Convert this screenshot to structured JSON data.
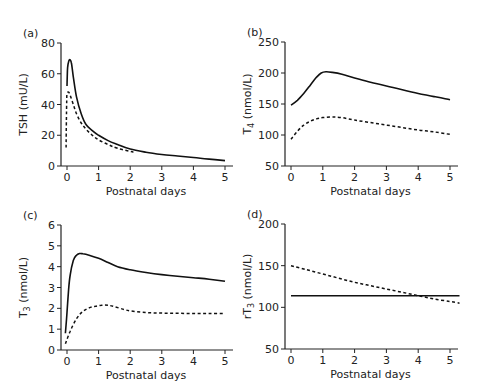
{
  "chart_data": [
    {
      "panel": "(a)",
      "type": "line",
      "xlabel": "Postnatal days",
      "ylabel": "TSH (mU/L)",
      "xlim": [
        0,
        5
      ],
      "ylim": [
        0,
        80
      ],
      "xticks": [
        0,
        1,
        2,
        3,
        4,
        5
      ],
      "yticks": [
        0,
        20,
        40,
        60,
        80
      ],
      "grid": false,
      "frame": {
        "x0": 61,
        "yTop": 43,
        "yBot": 166,
        "px0": 67,
        "px5": 225
      },
      "series": [
        {
          "name": "solid",
          "style": "solid",
          "x": [
            0,
            0.02,
            0.06,
            0.1,
            0.14,
            0.2,
            0.3,
            0.45,
            0.6,
            0.8,
            1.0,
            1.3,
            1.6,
            2.0,
            2.5,
            3.0,
            3.5,
            4.0,
            4.5,
            5.0
          ],
          "y": [
            52,
            64,
            68.5,
            69,
            67,
            58,
            45,
            34,
            27,
            23,
            20,
            16.5,
            14,
            11,
            9,
            7.5,
            6.5,
            5.5,
            4.5,
            3.5
          ]
        },
        {
          "name": "dashed",
          "style": "dashed",
          "x": [
            -0.03,
            -0.02,
            -0.01,
            0,
            0.05,
            0.1,
            0.2,
            0.3,
            0.45,
            0.6,
            0.8,
            1.0,
            1.3,
            1.6,
            2.1
          ],
          "y": [
            12,
            30,
            42,
            47,
            48,
            46,
            40,
            34,
            28,
            24,
            20,
            17,
            14,
            11.5,
            9
          ]
        }
      ]
    },
    {
      "panel": "(b)",
      "type": "line",
      "xlabel": "Postnatal days",
      "ylabel": "T4 (nmol/L)",
      "ylabel_main": "T",
      "ylabel_sub": "4",
      "ylabel_tail": " (nmol/L)",
      "xlim": [
        0,
        5
      ],
      "ylim": [
        50,
        250
      ],
      "xticks": [
        0,
        1,
        2,
        3,
        4,
        5
      ],
      "yticks": [
        50,
        100,
        150,
        200,
        250
      ],
      "grid": false,
      "frame": {
        "x0": 285,
        "yTop": 42,
        "yBot": 166,
        "px0": 291,
        "px5": 450
      },
      "series": [
        {
          "name": "solid",
          "style": "solid",
          "x": [
            0,
            0.2,
            0.4,
            0.6,
            0.8,
            0.95,
            1.1,
            1.3,
            1.6,
            2.0,
            2.5,
            3.0,
            3.5,
            4.0,
            4.5,
            5.0
          ],
          "y": [
            148,
            156,
            167,
            180,
            193,
            200,
            202,
            201,
            198,
            192,
            185,
            179,
            173,
            167,
            162,
            157
          ]
        },
        {
          "name": "dashed",
          "style": "dashed",
          "x": [
            0,
            0.2,
            0.4,
            0.6,
            0.8,
            1.0,
            1.3,
            1.6,
            2.0,
            2.5,
            3.0,
            3.5,
            4.0,
            4.5,
            5.0
          ],
          "y": [
            93,
            106,
            116,
            122,
            126,
            128,
            129,
            128,
            124,
            120,
            116,
            112,
            108,
            105,
            101
          ]
        }
      ]
    },
    {
      "panel": "(c)",
      "type": "line",
      "xlabel": "Postnatal days",
      "ylabel": "T3 (nmol/L)",
      "ylabel_main": "T",
      "ylabel_sub": "3",
      "ylabel_tail": " (nmol/L)",
      "xlim": [
        0,
        5
      ],
      "ylim": [
        0,
        6
      ],
      "xticks": [
        0,
        1,
        2,
        3,
        4,
        5
      ],
      "yticks": [
        0,
        1,
        2,
        3,
        4,
        5,
        6
      ],
      "grid": false,
      "frame": {
        "x0": 61,
        "yTop": 225,
        "yBot": 350,
        "px0": 67,
        "px5": 225
      },
      "series": [
        {
          "name": "solid",
          "style": "solid",
          "x": [
            -0.05,
            0,
            0.05,
            0.1,
            0.2,
            0.3,
            0.4,
            0.5,
            0.7,
            1.0,
            1.3,
            1.6,
            2.0,
            2.5,
            3.0,
            3.5,
            4.0,
            4.5,
            5.0
          ],
          "y": [
            0.8,
            1.8,
            2.9,
            3.6,
            4.3,
            4.55,
            4.63,
            4.62,
            4.55,
            4.4,
            4.2,
            4.0,
            3.85,
            3.72,
            3.62,
            3.54,
            3.47,
            3.4,
            3.3
          ]
        },
        {
          "name": "dashed",
          "style": "dashed",
          "x": [
            -0.05,
            0.1,
            0.3,
            0.5,
            0.7,
            0.9,
            1.1,
            1.3,
            1.5,
            1.8,
            2.0,
            2.5,
            3.0,
            3.5,
            4.0,
            4.5,
            5.0
          ],
          "y": [
            0.3,
            0.9,
            1.5,
            1.85,
            2.02,
            2.1,
            2.15,
            2.15,
            2.08,
            1.95,
            1.88,
            1.8,
            1.77,
            1.76,
            1.75,
            1.75,
            1.75
          ]
        }
      ]
    },
    {
      "panel": "(d)",
      "type": "line",
      "xlabel": "Postnatal days",
      "ylabel": "rT3 (nmol/L)",
      "ylabel_main": "rT",
      "ylabel_sub": "3",
      "ylabel_tail": " (nmol/L)",
      "xlim": [
        0,
        5
      ],
      "ylim": [
        50,
        200
      ],
      "xticks": [
        0,
        1,
        2,
        3,
        4,
        5
      ],
      "yticks": [
        50,
        100,
        150,
        200
      ],
      "grid": false,
      "frame": {
        "x0": 285,
        "yTop": 224,
        "yBot": 349,
        "px0": 291,
        "px5": 450
      },
      "series": [
        {
          "name": "solid",
          "style": "solid",
          "x": [
            0,
            5.3
          ],
          "y": [
            114,
            114
          ]
        },
        {
          "name": "dashed",
          "style": "dashed",
          "x": [
            0,
            0.5,
            1.0,
            1.5,
            2.0,
            2.5,
            3.0,
            3.5,
            4.0,
            4.5,
            5.0,
            5.3
          ],
          "y": [
            150,
            145,
            140,
            135,
            130,
            126,
            122,
            118,
            114,
            110,
            107,
            105
          ]
        }
      ]
    }
  ]
}
